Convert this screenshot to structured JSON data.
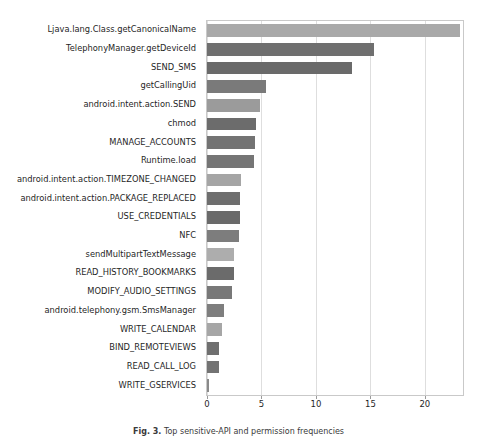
{
  "figure": {
    "caption_label": "Fig. 3.",
    "caption_text": "Top sensitive-API and permission frequencies"
  },
  "chart_data": {
    "type": "bar",
    "orientation": "horizontal",
    "title": "",
    "xlabel": "",
    "ylabel": "",
    "xlim": [
      0,
      23.5
    ],
    "ylim": [
      0,
      20
    ],
    "grid": true,
    "legend": "none",
    "xticks": [
      0,
      5,
      10,
      15,
      20
    ],
    "xticklabels": [
      "0",
      "5",
      "10",
      "15",
      "20"
    ],
    "categories": [
      "Ljava.lang.Class.getCanonicalName",
      "TelephonyManager.getDeviceId",
      "SEND_SMS",
      "getCallingUid",
      "android.intent.action.SEND",
      "chmod",
      "MANAGE_ACCOUNTS",
      "Runtime.load",
      "android.intent.action.TIMEZONE_CHANGED",
      "android.intent.action.PACKAGE_REPLACED",
      "USE_CREDENTIALS",
      "NFC",
      "sendMultipartTextMessage",
      "READ_HISTORY_BOOKMARKS",
      "MODIFY_AUDIO_SETTINGS",
      "android.telephony.gsm.SmsManager",
      "WRITE_CALENDAR",
      "BIND_REMOTEVIEWS",
      "READ_CALL_LOG",
      "WRITE_GSERVICES"
    ],
    "values": [
      23.2,
      15.3,
      13.3,
      5.4,
      4.9,
      4.5,
      4.4,
      4.3,
      3.1,
      3.0,
      3.0,
      2.9,
      2.5,
      2.5,
      2.3,
      1.6,
      1.4,
      1.1,
      1.1,
      0.15
    ],
    "colors": [
      "#a9a9a9",
      "#6f6f6f",
      "#6a6a6a",
      "#7a7a7a",
      "#9b9b9b",
      "#6c6c6c",
      "#737373",
      "#757575",
      "#a5a5a5",
      "#6e6e6e",
      "#6a6a6a",
      "#7d7d7d",
      "#adadad",
      "#6b6b6b",
      "#787878",
      "#7e7e7e",
      "#a6a6a6",
      "#6f6f6f",
      "#737373",
      "#8a8a8a"
    ]
  }
}
